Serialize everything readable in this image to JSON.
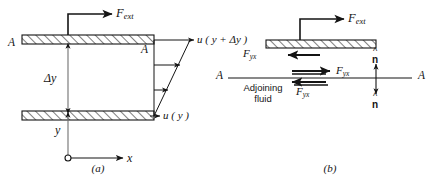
{
  "figure": {
    "type": "physics-diagram",
    "background_color": "#ffffff",
    "line_color": "#141414",
    "hatch_color": "#141414"
  },
  "panel_a": {
    "caption": "(a)",
    "force_label": "F",
    "force_subscript": "ext",
    "plate_top_label": "A",
    "plate_section_label": "A",
    "gap_label": "Δy",
    "height_label": "y",
    "x_axis_label": "x",
    "velocity_top_label": "u ( y + Δy )",
    "velocity_bottom_label": "u ( y )",
    "velocity_top_text": "u",
    "velocity_top_arg": "( y + Δy )",
    "velocity_bottom_text": "u",
    "velocity_bottom_arg": "( y )",
    "origin_marker": "open-circle",
    "num_profile_arrows": 4
  },
  "panel_b": {
    "caption": "(b)",
    "force_label": "F",
    "force_subscript": "ext",
    "shear_label": "F",
    "shear_subscript": "yx",
    "shear_on_plate_label": "F",
    "shear_upper_fluid_label": "F",
    "shear_lower_fluid_label": "F",
    "fluid_label_line1": "Adjoining",
    "fluid_label_line2": "fluid",
    "interface_left_label": "A",
    "interface_right_label": "A",
    "normal_up_label": "n",
    "normal_down_label": "n",
    "normal_hat": "^"
  }
}
